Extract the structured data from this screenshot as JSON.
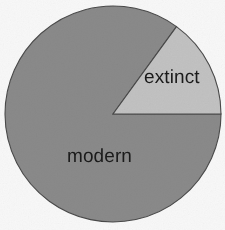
{
  "figure": {
    "width": 225,
    "height": 230,
    "background_color": "#f8f8f8"
  },
  "chart_data": {
    "type": "pie",
    "title": "",
    "subtitle": "",
    "xlabel": "",
    "ylabel": "",
    "grid": false,
    "legend_position": "none",
    "labels_inside_slices": true,
    "start_angle_deg": 0,
    "direction": "counterclockwise",
    "categories": [
      "extinct",
      "modern"
    ],
    "values": [
      15,
      85
    ],
    "value_unit": "percent",
    "colors": [
      "#c2c2c2",
      "#8a8a8a"
    ],
    "slice_border_color": "#4a4a4a",
    "slices": [
      {
        "label": "extinct",
        "value": 15,
        "color": "#c2c2c2",
        "start_angle_deg": 0,
        "end_angle_deg": 54,
        "label_color": "#1b1b1b"
      },
      {
        "label": "modern",
        "value": 85,
        "color": "#8a8a8a",
        "start_angle_deg": 54,
        "end_angle_deg": 360,
        "label_color": "#1b1b1b"
      }
    ],
    "geometry": {
      "center_x": 113,
      "center_y": 114,
      "radius": 108
    }
  }
}
